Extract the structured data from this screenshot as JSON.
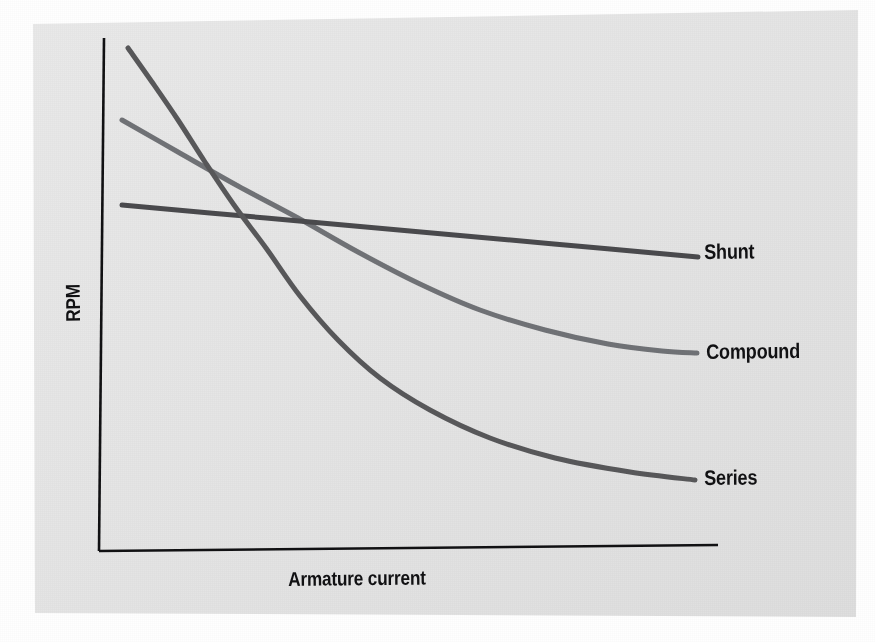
{
  "figure": {
    "background_color": "#ffffff",
    "panel_color": "#e6e6e6",
    "panel_color_dark": "#dedede"
  },
  "chart_data": {
    "type": "line",
    "title": "",
    "subtitle": "",
    "xlabel": "Armature current",
    "ylabel": "RPM",
    "xlim": [
      0,
      100
    ],
    "ylim": [
      0,
      100
    ],
    "x_tick_labels": [],
    "y_tick_labels": [],
    "grid": false,
    "legend_position": "right-inline-labels",
    "annotations": [
      "Series has the steepest speed drop with load",
      "Compound falls between Series and Shunt",
      "Shunt speed is nearly constant"
    ],
    "series": [
      {
        "name": "Series",
        "color": "#58585a",
        "line_width": 5,
        "label_x": 704,
        "label_y": 466,
        "x": [
          0,
          4,
          8,
          13,
          19,
          25,
          32,
          40,
          49,
          59,
          70,
          82,
          95,
          100
        ],
        "y": [
          98,
          89,
          79,
          68,
          57,
          47,
          38,
          31,
          25,
          21,
          18,
          16,
          15,
          14
        ],
        "points_px": [
          [
            128,
            48
          ],
          [
            152,
            82
          ],
          [
            178,
            120
          ],
          [
            205,
            162
          ],
          [
            234,
            205
          ],
          [
            266,
            248
          ],
          [
            300,
            296
          ],
          [
            338,
            340
          ],
          [
            380,
            378
          ],
          [
            430,
            410
          ],
          [
            490,
            438
          ],
          [
            555,
            458
          ],
          [
            630,
            472
          ],
          [
            695,
            480
          ]
        ]
      },
      {
        "name": "Compound",
        "color": "#707276",
        "line_width": 5,
        "label_x": 706,
        "label_y": 340,
        "x": [
          0,
          8,
          17,
          26,
          36,
          47,
          58,
          70,
          82,
          92,
          100
        ],
        "y": [
          85,
          79,
          73,
          67,
          60,
          53,
          46,
          40,
          35,
          32,
          31
        ],
        "points_px": [
          [
            122,
            120
          ],
          [
            178,
            152
          ],
          [
            238,
            186
          ],
          [
            298,
            218
          ],
          [
            358,
            252
          ],
          [
            420,
            284
          ],
          [
            480,
            310
          ],
          [
            545,
            330
          ],
          [
            608,
            344
          ],
          [
            662,
            351
          ],
          [
            697,
            353
          ]
        ]
      },
      {
        "name": "Shunt",
        "color": "#4a4a4d",
        "line_width": 5,
        "label_x": 704,
        "label_y": 240,
        "x": [
          0,
          25,
          50,
          75,
          100
        ],
        "y": [
          70,
          67,
          65,
          62,
          60
        ],
        "points_px": [
          [
            122,
            205
          ],
          [
            266,
            218
          ],
          [
            410,
            231
          ],
          [
            554,
            244
          ],
          [
            698,
            257
          ]
        ]
      }
    ],
    "axes": {
      "y_axis_px": [
        [
          104,
          38
        ],
        [
          99,
          551
        ]
      ],
      "x_axis_px": [
        [
          99,
          551
        ],
        [
          718,
          545
        ]
      ],
      "axis_color": "#111113",
      "axis_width": 2.6
    },
    "crossings_px": {
      "series_x_shunt": [
        216,
        209
      ],
      "series_x_compound": [
        190,
        132
      ],
      "compound_x_shunt": [
        366,
        228
      ]
    }
  },
  "labels": {
    "y_axis": "RPM",
    "x_axis": "Armature current",
    "shunt": "Shunt",
    "compound": "Compound",
    "series": "Series"
  }
}
